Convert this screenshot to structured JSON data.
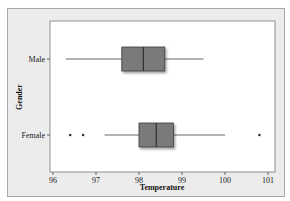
{
  "chart_data": {
    "type": "boxplot",
    "orientation": "horizontal",
    "title": "",
    "xlabel": "Temperature",
    "ylabel": "Gender",
    "xlim": [
      95.9,
      101.1
    ],
    "xticks": [
      96,
      97,
      98,
      99,
      100,
      101
    ],
    "xtick_labels": [
      "96",
      "97",
      "98",
      "99",
      "100",
      "101"
    ],
    "categories": [
      "Male",
      "Female"
    ],
    "grid": false,
    "legend": null,
    "series": [
      {
        "name": "Male",
        "whisker_low": 96.3,
        "q1": 97.6,
        "median": 98.1,
        "q3": 98.6,
        "whisker_high": 99.5,
        "outliers": []
      },
      {
        "name": "Female",
        "whisker_low": 97.2,
        "q1": 98.0,
        "median": 98.4,
        "q3": 98.8,
        "whisker_high": 100.0,
        "outliers": [
          96.4,
          96.7,
          100.8
        ]
      }
    ],
    "colors": {
      "box_fill": "#7a7a7a",
      "box_stroke": "#3a3a3a",
      "whisker": "#555555",
      "plot_bg": "#ffffff",
      "frame_bg": "#ececec"
    }
  }
}
